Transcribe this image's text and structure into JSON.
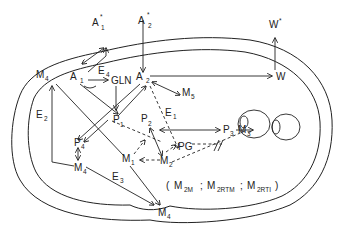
{
  "diagram": {
    "type": "metabolic-compartment-flow-diagram",
    "external_nodes": [
      {
        "id": "A1*",
        "label": "A",
        "sub": "1",
        "sup": "*"
      },
      {
        "id": "A2*",
        "label": "A",
        "sub": "2",
        "sup": "*"
      },
      {
        "id": "W*",
        "label": "W",
        "sup": "*"
      }
    ],
    "nodes": [
      {
        "id": "A1",
        "label": "A",
        "sub": "1"
      },
      {
        "id": "A2",
        "label": "A",
        "sub": "2"
      },
      {
        "id": "GLN",
        "label": "GLN"
      },
      {
        "id": "W",
        "label": "W"
      },
      {
        "id": "M5",
        "label": "M",
        "sub": "5"
      },
      {
        "id": "P1",
        "label": "P",
        "sub": "1"
      },
      {
        "id": "P2",
        "label": "P",
        "sub": "2"
      },
      {
        "id": "P3",
        "label": "P",
        "sub": "3"
      },
      {
        "id": "M3",
        "label": "M",
        "sub": "3"
      },
      {
        "id": "PG",
        "label": "PG"
      },
      {
        "id": "M1",
        "label": "M",
        "sub": "1"
      },
      {
        "id": "M2",
        "label": "M",
        "sub": "2"
      },
      {
        "id": "P4",
        "label": "P",
        "sub": "4"
      },
      {
        "id": "M4a",
        "label": "M",
        "sub": "4"
      },
      {
        "id": "M4b",
        "label": "M",
        "sub": "4"
      },
      {
        "id": "M4c",
        "label": "M",
        "sub": "4"
      }
    ],
    "enzymes": [
      {
        "id": "E1",
        "label": "E",
        "sub": "1"
      },
      {
        "id": "E2",
        "label": "E",
        "sub": "2"
      },
      {
        "id": "E3",
        "label": "E",
        "sub": "3"
      },
      {
        "id": "E4",
        "label": "E",
        "sub": "4"
      }
    ],
    "legend": {
      "open": "(",
      "items": [
        {
          "label": "M",
          "sub": "2M"
        },
        {
          "label": "M",
          "sub": "2RTM"
        },
        {
          "label": "M",
          "sub": "2RTI"
        }
      ],
      "sep": ";",
      "close": ")"
    },
    "edges": [
      {
        "from": "A1*",
        "to": "A1",
        "style": "solid",
        "bidirectional": true
      },
      {
        "from": "A2*",
        "to": "A2",
        "style": "solid"
      },
      {
        "from": "A2",
        "to": "W",
        "style": "solid"
      },
      {
        "from": "W",
        "to": "W*",
        "style": "solid"
      },
      {
        "from": "A1",
        "to": "GLN",
        "style": "solid"
      },
      {
        "from": "A2",
        "to": "M5",
        "style": "solid",
        "bidirectional": true
      },
      {
        "from": "GLN",
        "to": "P1",
        "style": "solid"
      },
      {
        "from": "A1",
        "to": "P1",
        "style": "solid"
      },
      {
        "from": "P1",
        "to": "A2",
        "style": "solid"
      },
      {
        "from": "A2",
        "to": "P4",
        "style": "solid"
      },
      {
        "from": "P1",
        "to": "P4",
        "style": "solid"
      },
      {
        "from": "P4",
        "to": "M4b",
        "style": "solid",
        "bidirectional": true
      },
      {
        "from": "M4b",
        "to": "M4c",
        "style": "solid"
      },
      {
        "from": "M1",
        "to": "M4c",
        "style": "solid"
      },
      {
        "from": "M1",
        "to": "M4a",
        "style": "solid"
      },
      {
        "from": "M4a",
        "to": "A1",
        "style": "solid",
        "bidirectional": true
      },
      {
        "from": "P2",
        "to": "P3",
        "style": "solid",
        "bidirectional": true,
        "enzyme": "E1"
      },
      {
        "from": "P3",
        "to": "M3",
        "style": "solid"
      },
      {
        "from": "P2",
        "to": "M2",
        "style": "solid",
        "bidirectional": true
      },
      {
        "from": "P1",
        "to": "M2",
        "style": "dashed"
      },
      {
        "from": "A2",
        "to": "PG",
        "style": "dashed"
      },
      {
        "from": "M2",
        "to": "M1",
        "style": "dashed"
      },
      {
        "from": "M1",
        "to": "P2",
        "style": "dashed"
      },
      {
        "from": "M2",
        "to": "PG",
        "style": "dashed"
      },
      {
        "from": "PG",
        "to": "blocked",
        "style": "dashed",
        "inhibited": true
      },
      {
        "from": "M2",
        "to": "organelle",
        "style": "dashed",
        "inhibited": true
      }
    ]
  }
}
